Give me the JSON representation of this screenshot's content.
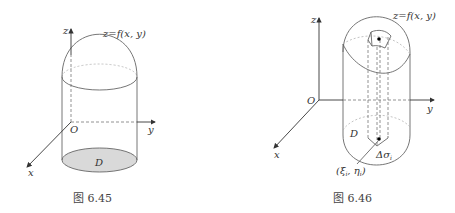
{
  "figures": [
    {
      "id": "fig-6-45",
      "caption": "图 6.45",
      "surface_label": "z=f(x, y)",
      "axis_labels": {
        "x": "x",
        "y": "y",
        "z": "z",
        "origin": "O"
      },
      "region_label": "D",
      "region_fill": "#d9d9d9"
    },
    {
      "id": "fig-6-46",
      "caption": "图 6.46",
      "surface_label": "z=f(x, y)",
      "axis_labels": {
        "x": "x",
        "y": "y",
        "z": "z",
        "origin": "O"
      },
      "region_label": "D",
      "patch_label": "Δσ",
      "patch_sub": "i",
      "point_label": "(ξ",
      "point_sub1": "i",
      "point_mid": ", η",
      "point_sub2": "i",
      "point_end": ")"
    }
  ]
}
